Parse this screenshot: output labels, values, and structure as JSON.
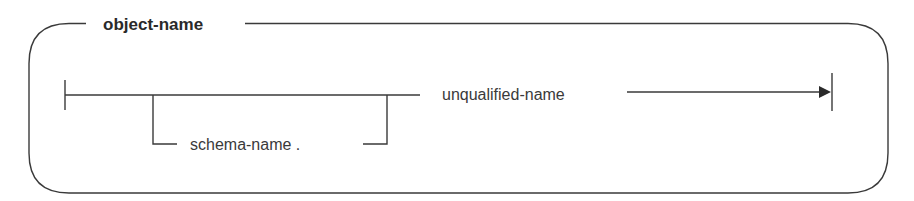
{
  "diagram": {
    "type": "syntax-diagram",
    "title": "object-name",
    "optional_item": {
      "label": "schema-name .",
      "name": "schema-name",
      "separator": "."
    },
    "required_item": {
      "label": "unqualified-name"
    },
    "colors": {
      "line": "#3a3a3a",
      "text": "#2a2a2a",
      "background": "#ffffff"
    }
  }
}
